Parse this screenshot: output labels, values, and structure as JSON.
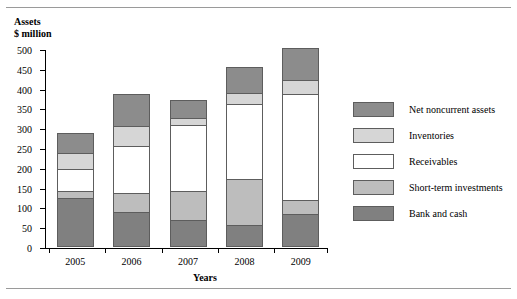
{
  "chart_data": {
    "type": "bar",
    "subtype": "stacked-bar",
    "title": "",
    "xlabel": "Years",
    "ylabel": "Assets\n$ million",
    "ylim": [
      0,
      500
    ],
    "ytick_step": 50,
    "yticks": [
      "500",
      "450",
      "400",
      "350",
      "300",
      "250",
      "200",
      "150",
      "100",
      "50",
      "0"
    ],
    "grid": false,
    "legend_position": "right",
    "categories": [
      "2005",
      "2006",
      "2007",
      "2008",
      "2009"
    ],
    "series": [
      {
        "name": "Bank and cash",
        "color": "#808080",
        "values": [
          120,
          85,
          65,
          52,
          80
        ]
      },
      {
        "name": "Short-term investments",
        "color": "#bdbdbd",
        "values": [
          20,
          50,
          75,
          118,
          35
        ]
      },
      {
        "name": "Receivables",
        "color": "#ffffff",
        "values": [
          55,
          118,
          165,
          188,
          270
        ]
      },
      {
        "name": "Inventories",
        "color": "#d6d6d6",
        "values": [
          40,
          50,
          18,
          28,
          35
        ]
      },
      {
        "name": "Net noncurrent assets",
        "color": "#8c8c8c",
        "values": [
          50,
          82,
          45,
          67,
          80
        ]
      }
    ],
    "totals": [
      285,
      385,
      368,
      453,
      500
    ]
  },
  "legend": {
    "items": [
      {
        "label": "Net noncurrent assets",
        "color": "#8c8c8c"
      },
      {
        "label": "Inventories",
        "color": "#d6d6d6"
      },
      {
        "label": "Receivables",
        "color": "#ffffff"
      },
      {
        "label": "Short-term investments",
        "color": "#bdbdbd"
      },
      {
        "label": "Bank and cash",
        "color": "#808080"
      }
    ]
  }
}
